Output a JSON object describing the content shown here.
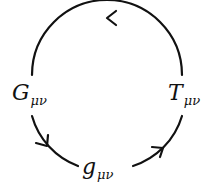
{
  "diagram": {
    "type": "cycle",
    "stroke_color": "#111111",
    "nodes": [
      {
        "id": "G",
        "symbol": "G",
        "subscript": "μν",
        "position": "left"
      },
      {
        "id": "T",
        "symbol": "T",
        "subscript": "μν",
        "position": "right"
      },
      {
        "id": "g",
        "symbol": "g",
        "subscript": "μν",
        "position": "bottom"
      }
    ],
    "edges": [
      {
        "from": "T",
        "to": "G",
        "path": "top-arc",
        "arrow_direction": "left"
      },
      {
        "from": "G",
        "to": "g",
        "path": "lower-left-arc",
        "arrow_direction": "down-right"
      },
      {
        "from": "g",
        "to": "T",
        "path": "lower-right-arc",
        "arrow_direction": "up-right"
      }
    ]
  }
}
